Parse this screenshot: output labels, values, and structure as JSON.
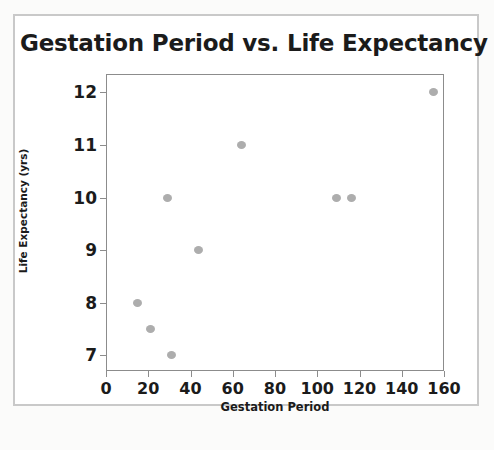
{
  "figure": {
    "title": "Gestation Period vs. Life Expectancy",
    "frame_color": "#c9c9c9",
    "plot_border_color": "#8c8c8c",
    "background_color": "#ffffff"
  },
  "chart_data": {
    "type": "scatter",
    "title": "Gestation Period vs. Life Expectancy",
    "xlabel": "Gestation Period",
    "ylabel": "Life Expectancy (yrs)",
    "xlim": [
      0,
      160
    ],
    "ylim": [
      6.7,
      12.35
    ],
    "xticks": [
      0,
      20,
      40,
      60,
      80,
      100,
      120,
      140,
      160
    ],
    "yticks": [
      7,
      8,
      9,
      10,
      11,
      12
    ],
    "xtick_labels": [
      "0",
      "20",
      "40",
      "60",
      "80",
      "100",
      "120",
      "140",
      "160"
    ],
    "ytick_labels": [
      "7",
      "8",
      "9",
      "10",
      "11",
      "12"
    ],
    "grid": false,
    "legend": null,
    "marker_color": "#adadad",
    "points": [
      {
        "x": 15,
        "y": 8
      },
      {
        "x": 21,
        "y": 7.5
      },
      {
        "x": 29,
        "y": 10
      },
      {
        "x": 31,
        "y": 7
      },
      {
        "x": 44,
        "y": 9
      },
      {
        "x": 64,
        "y": 11
      },
      {
        "x": 109,
        "y": 10
      },
      {
        "x": 116,
        "y": 10
      },
      {
        "x": 155,
        "y": 12
      }
    ]
  }
}
